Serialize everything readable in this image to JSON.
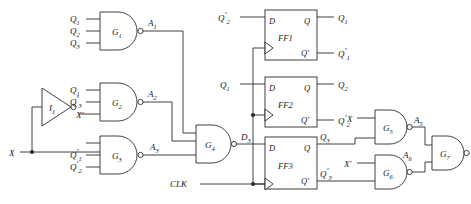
{
  "diagram": {
    "type": "logic-circuit-schematic",
    "ink_color": "#2b2b2b",
    "background_color": "#ffffff"
  },
  "inputs": {
    "data_input": "X",
    "data_input_inverted": "X'",
    "clock": "CLK"
  },
  "output": {
    "label": "Z"
  },
  "inverters": [
    {
      "name": "I1",
      "label": "I",
      "sub": "1",
      "input": "X",
      "output": "X'"
    }
  ],
  "gates": [
    {
      "name": "G1",
      "label": "G",
      "sub": "1",
      "type": "nand",
      "inputs": [
        "Q1",
        "Q2",
        "Q3"
      ],
      "output_label": "A",
      "output_sub": "1",
      "input_labels": [
        {
          "base": "Q",
          "sub": "1",
          "prime": false
        },
        {
          "base": "Q",
          "sub": "2",
          "prime": false
        },
        {
          "base": "Q",
          "sub": "3",
          "prime": false
        }
      ]
    },
    {
      "name": "G2",
      "label": "G",
      "sub": "2",
      "type": "nand",
      "inputs": [
        "Q1",
        "Q3'",
        "X'"
      ],
      "output_label": "A",
      "output_sub": "2",
      "input_labels": [
        {
          "base": "Q",
          "sub": "1",
          "prime": false
        },
        {
          "base": "Q",
          "sub": "3",
          "prime": true
        }
      ]
    },
    {
      "name": "G3",
      "label": "G",
      "sub": "3",
      "type": "nand",
      "inputs": [
        "X",
        "Q1'",
        "Q2'"
      ],
      "output_label": "A",
      "output_sub": "3",
      "input_labels": [
        {
          "base": "Q",
          "sub": "1",
          "prime": true
        },
        {
          "base": "Q",
          "sub": "2",
          "prime": true
        }
      ]
    },
    {
      "name": "G4",
      "label": "G",
      "sub": "4",
      "type": "nand",
      "inputs": [
        "A1",
        "A2",
        "A3"
      ],
      "output_label": "D",
      "output_sub": "3",
      "input_labels": []
    },
    {
      "name": "G5",
      "label": "G",
      "sub": "5",
      "type": "nand",
      "inputs": [
        "X",
        "Q3"
      ],
      "output_label": "A",
      "output_sub": "5",
      "input_labels": [
        {
          "base": "X",
          "sub": "",
          "prime": false
        }
      ]
    },
    {
      "name": "G6",
      "label": "G",
      "sub": "6",
      "type": "nand",
      "inputs": [
        "X'",
        "Q3'"
      ],
      "output_label": "A",
      "output_sub": "6",
      "input_labels": [
        {
          "base": "X",
          "sub": "",
          "prime": true
        }
      ]
    },
    {
      "name": "G7",
      "label": "G",
      "sub": "7",
      "type": "nand",
      "inputs": [
        "A5",
        "A6"
      ],
      "output_label": "Z",
      "output_sub": "",
      "input_labels": []
    }
  ],
  "flipflops": [
    {
      "name": "FF1",
      "label": "FF",
      "sub": "1",
      "d_pin": "D",
      "q_pin": "Q",
      "qbar_pin": "Q'",
      "d_input": {
        "base": "Q",
        "sub": "2",
        "prime": true
      },
      "q_out": {
        "base": "Q",
        "sub": "1",
        "prime": false
      },
      "qbar_out": {
        "base": "Q",
        "sub": "1",
        "prime": true
      }
    },
    {
      "name": "FF2",
      "label": "FF",
      "sub": "2",
      "d_pin": "D",
      "q_pin": "Q",
      "qbar_pin": "Q'",
      "d_input": {
        "base": "Q",
        "sub": "1",
        "prime": false
      },
      "q_out": {
        "base": "Q",
        "sub": "2",
        "prime": false
      },
      "qbar_out": {
        "base": "Q",
        "sub": "2",
        "prime": true
      }
    },
    {
      "name": "FF3",
      "label": "FF",
      "sub": "3",
      "d_pin": "D",
      "q_pin": "Q",
      "qbar_pin": "Q'",
      "d_input": {
        "base": "D",
        "sub": "3",
        "prime": false
      },
      "q_out": {
        "base": "Q",
        "sub": "3",
        "prime": false
      },
      "qbar_out": {
        "base": "Q",
        "sub": "3",
        "prime": true
      }
    }
  ],
  "intermediate_signals": [
    {
      "base": "A",
      "sub": "1"
    },
    {
      "base": "A",
      "sub": "2"
    },
    {
      "base": "A",
      "sub": "3"
    },
    {
      "base": "A",
      "sub": "5"
    },
    {
      "base": "A",
      "sub": "6"
    },
    {
      "base": "D",
      "sub": "3"
    }
  ]
}
